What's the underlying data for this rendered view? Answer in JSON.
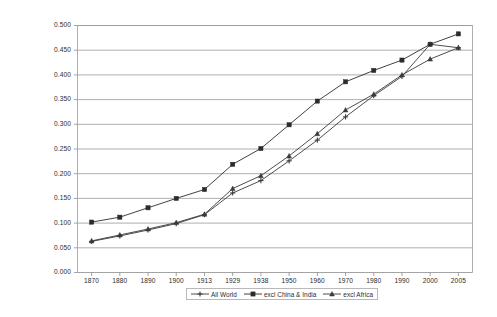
{
  "chart_data": {
    "type": "line",
    "title": "",
    "xlabel": "",
    "ylabel": "",
    "categories": [
      "1870",
      "1880",
      "1890",
      "1900",
      "1913",
      "1929",
      "1938",
      "1950",
      "1960",
      "1970",
      "1980",
      "1990",
      "2000",
      "2005"
    ],
    "ylim": [
      0.0,
      0.5
    ],
    "ytick_labels": [
      "0.000",
      "0.050",
      "0.100",
      "0.150",
      "0.200",
      "0.250",
      "0.300",
      "0.350",
      "0.400",
      "0.450",
      "0.500"
    ],
    "ytick_values": [
      0.0,
      0.05,
      0.1,
      0.15,
      0.2,
      0.25,
      0.3,
      0.35,
      0.4,
      0.45,
      0.5
    ],
    "grid": "horizontal",
    "legend_position": "bottom",
    "series": [
      {
        "name": "All World",
        "marker": "cross",
        "color": "#3a3a3a",
        "values": [
          0.063,
          0.074,
          0.086,
          0.099,
          0.117,
          0.161,
          0.186,
          0.226,
          0.268,
          0.315,
          0.358,
          0.397,
          0.462,
          0.455
        ]
      },
      {
        "name": "excl China & India",
        "marker": "square",
        "color": "#2b2b2b",
        "values": [
          0.102,
          0.112,
          0.131,
          0.15,
          0.168,
          0.219,
          0.251,
          0.299,
          0.347,
          0.386,
          0.409,
          0.43,
          0.462,
          0.483
        ]
      },
      {
        "name": "excl Africa",
        "marker": "triangle",
        "color": "#3a3a3a",
        "values": [
          0.064,
          0.076,
          0.088,
          0.101,
          0.118,
          0.17,
          0.196,
          0.236,
          0.281,
          0.329,
          0.361,
          0.4,
          0.432,
          0.455
        ]
      }
    ]
  },
  "legend": {
    "items": [
      {
        "label": "All World",
        "marker": "cross-marker"
      },
      {
        "label": "excl China & India",
        "marker": "square-marker"
      },
      {
        "label": "excl Africa",
        "marker": "triangle-marker"
      }
    ]
  }
}
